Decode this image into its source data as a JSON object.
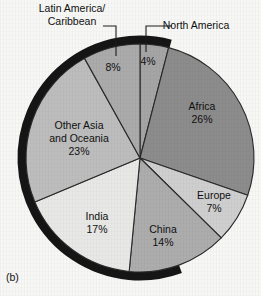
{
  "figure": {
    "caption": "(b)",
    "background_color": "#f7f7f5",
    "rim_color": "#151515",
    "outline_color": "#2a2a2a"
  },
  "chart_data": {
    "type": "pie",
    "title": "",
    "xlabel": "",
    "ylabel": "",
    "legend_position": "none",
    "grid": false,
    "start_angle_deg": 0,
    "direction": "clockwise",
    "center": {
      "x": 140,
      "y": 158
    },
    "radius": 114,
    "total": 99,
    "units": "%",
    "categories": [
      "North America",
      "Africa",
      "Europe",
      "China",
      "India",
      "Other Asia and Oceania",
      "Latin America/Caribbean"
    ],
    "values": [
      4,
      26,
      7,
      14,
      17,
      23,
      8
    ],
    "slices": [
      {
        "name": "North America",
        "label_lines": [
          "North America"
        ],
        "percent_label": "4%",
        "value": 4,
        "color": "#a5a5a5",
        "label_placement": "external",
        "label_x": 196,
        "label_y": 26,
        "percent_x": 148,
        "percent_y": 62,
        "leader": {
          "x1": 172,
          "y1": 26,
          "x2": 146,
          "y2": 26,
          "x3": 146,
          "y3": 52
        }
      },
      {
        "name": "Africa",
        "label_lines": [
          "Africa",
          "26%"
        ],
        "percent_label": "26%",
        "value": 26,
        "color": "#8c8c8c",
        "label_placement": "internal",
        "label_x": 202,
        "label_y": 113
      },
      {
        "name": "Europe",
        "label_lines": [
          "Europe",
          "7%"
        ],
        "percent_label": "7%",
        "value": 7,
        "color": "#cfcfcf",
        "label_placement": "internal",
        "label_x": 214,
        "label_y": 202
      },
      {
        "name": "China",
        "label_lines": [
          "China",
          "14%"
        ],
        "percent_label": "14%",
        "value": 14,
        "color": "#adadad",
        "label_placement": "internal",
        "label_x": 163,
        "label_y": 236
      },
      {
        "name": "India",
        "label_lines": [
          "India",
          "17%"
        ],
        "percent_label": "17%",
        "value": 17,
        "color": "#e8e8e6",
        "label_placement": "internal",
        "label_x": 97,
        "label_y": 223
      },
      {
        "name": "Other Asia and Oceania",
        "label_lines": [
          "Other Asia",
          "and Oceania",
          "23%"
        ],
        "percent_label": "23%",
        "value": 23,
        "color": "#bdbdbd",
        "label_placement": "internal",
        "label_x": 79,
        "label_y": 139
      },
      {
        "name": "Latin America/Caribbean",
        "label_lines": [
          "Latin America/",
          "Caribbean"
        ],
        "percent_label": "8%",
        "value": 8,
        "color": "#ababab",
        "label_placement": "external",
        "label_x": 72,
        "label_y": 15,
        "percent_x": 113,
        "percent_y": 68,
        "leader": {
          "x1": 103,
          "y1": 26,
          "x2": 116,
          "y2": 26,
          "x3": 116,
          "y3": 56
        }
      }
    ]
  }
}
